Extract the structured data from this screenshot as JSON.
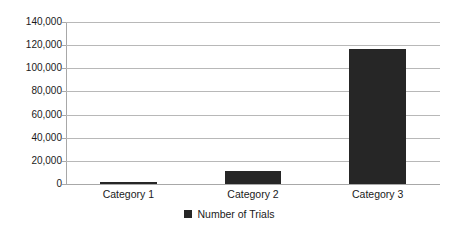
{
  "chart_data": {
    "type": "bar",
    "title": "",
    "subtitle": "",
    "xlabel": "",
    "ylabel": "",
    "categories": [
      "Category 1",
      "Category 2",
      "Category 3"
    ],
    "series": [
      {
        "name": "Number of Trials",
        "color": "#262626",
        "values": [
          2000,
          11000,
          117000
        ]
      }
    ],
    "ylim": [
      0,
      140000
    ],
    "ytick_step": 20000,
    "ytick_labels": [
      "0",
      "20,000",
      "40,000",
      "60,000",
      "80,000",
      "100,000",
      "120,000",
      "140,000"
    ],
    "ytick_values": [
      0,
      20000,
      40000,
      60000,
      80000,
      100000,
      120000,
      140000
    ],
    "grid": true,
    "grid_axis": "y",
    "legend": {
      "position": "bottom-center",
      "entries": [
        {
          "label": "Number of Trials",
          "color": "#262626",
          "marker": "square-swatch"
        }
      ]
    },
    "annotations": [],
    "axis_line_color": "#a8a8a8",
    "gridline_color": "#b8b8b8",
    "plot_background": "#ffffff"
  }
}
